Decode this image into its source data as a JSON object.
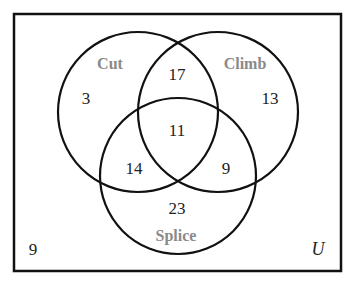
{
  "diagram": {
    "type": "venn",
    "universe_label": "U",
    "sets": [
      {
        "name": "Cut",
        "label": "Cut"
      },
      {
        "name": "Climb",
        "label": "Climb"
      },
      {
        "name": "Splice",
        "label": "Splice"
      }
    ],
    "regions": {
      "cut_only": "3",
      "climb_only": "13",
      "splice_only": "23",
      "cut_climb_only": "17",
      "cut_splice_only": "14",
      "climb_splice_only": "9",
      "all_three": "11",
      "outside": "9"
    }
  }
}
